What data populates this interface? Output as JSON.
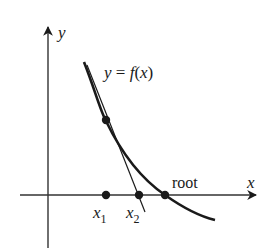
{
  "diagram": {
    "axes": {
      "x_label": "x",
      "y_label": "y"
    },
    "curve_label": "y = f(x)",
    "curve_label_parts": {
      "y": "y",
      "eq": " = ",
      "f": "f",
      "open": "(",
      "x": "x",
      "close": ")"
    },
    "points": [
      {
        "name": "x1",
        "label_base": "x",
        "label_sub": "1"
      },
      {
        "name": "x2",
        "label_base": "x",
        "label_sub": "2"
      },
      {
        "name": "root",
        "label": "root"
      }
    ],
    "colors": {
      "ink": "#1a1a1a",
      "axis": "#333333"
    }
  }
}
